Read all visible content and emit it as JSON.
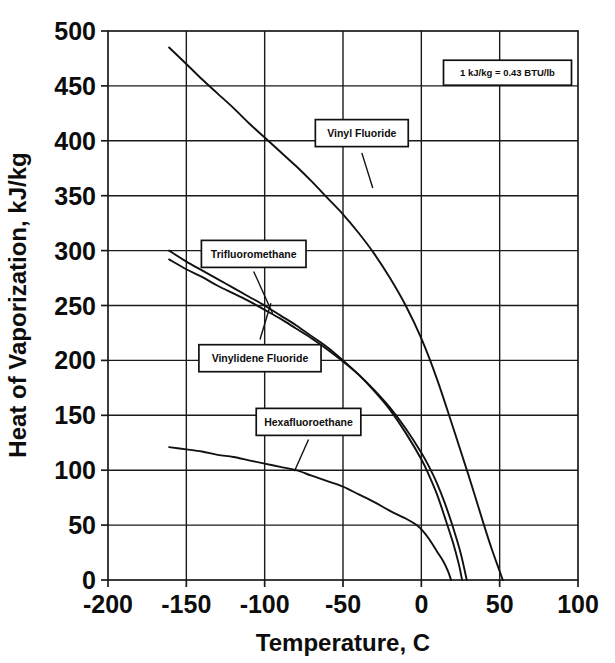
{
  "chart_data": {
    "type": "line",
    "title": "",
    "xlabel": "Temperature, C",
    "ylabel": "Heat of Vaporization, kJ/kg",
    "xlim": [
      -200,
      100
    ],
    "ylim": [
      0,
      500
    ],
    "xticks": [
      -200,
      -150,
      -100,
      -50,
      0,
      50,
      100
    ],
    "xtick_labels": [
      "-200",
      "-150",
      "-100",
      "-50",
      "0",
      "50",
      "100"
    ],
    "yticks": [
      0,
      50,
      100,
      150,
      200,
      250,
      300,
      350,
      400,
      450,
      500
    ],
    "ytick_labels": [
      "0",
      "50",
      "100",
      "150",
      "200",
      "250",
      "300",
      "350",
      "400",
      "450",
      "500"
    ],
    "grid": true,
    "legend_position": "inline-callouts",
    "annotations": [
      {
        "name": "unit-note",
        "text": "1 kJ/kg = 0.43 BTU/lb",
        "x": 55,
        "y": 462
      }
    ],
    "series": [
      {
        "name": "Vinyl Fluoride",
        "label_x": -38,
        "label_y": 407,
        "leader_from": [
          -38,
          389
        ],
        "leader_to": [
          -31,
          357
        ],
        "points": [
          [
            -161,
            485
          ],
          [
            -150,
            470
          ],
          [
            -140,
            456
          ],
          [
            -130,
            443
          ],
          [
            -120,
            430
          ],
          [
            -110,
            416
          ],
          [
            -100,
            403
          ],
          [
            -90,
            390
          ],
          [
            -80,
            377
          ],
          [
            -70,
            363
          ],
          [
            -60,
            348
          ],
          [
            -50,
            333
          ],
          [
            -40,
            316
          ],
          [
            -30,
            297
          ],
          [
            -20,
            275
          ],
          [
            -10,
            250
          ],
          [
            0,
            220
          ],
          [
            10,
            183
          ],
          [
            20,
            140
          ],
          [
            30,
            96
          ],
          [
            40,
            50
          ],
          [
            45,
            28
          ],
          [
            50,
            8
          ],
          [
            52,
            0
          ]
        ]
      },
      {
        "name": "Trifluoromethane",
        "label_x": -107,
        "label_y": 297,
        "leader_from": [
          -107,
          281
        ],
        "leader_to": [
          -95,
          243
        ],
        "points": [
          [
            -161,
            300
          ],
          [
            -150,
            290
          ],
          [
            -140,
            282
          ],
          [
            -130,
            274
          ],
          [
            -120,
            266
          ],
          [
            -110,
            258
          ],
          [
            -100,
            250
          ],
          [
            -90,
            241
          ],
          [
            -80,
            232
          ],
          [
            -70,
            222
          ],
          [
            -60,
            212
          ],
          [
            -50,
            200
          ],
          [
            -40,
            187
          ],
          [
            -30,
            172
          ],
          [
            -20,
            155
          ],
          [
            -10,
            134
          ],
          [
            0,
            110
          ],
          [
            5,
            95
          ],
          [
            10,
            78
          ],
          [
            15,
            57
          ],
          [
            20,
            35
          ],
          [
            24,
            14
          ],
          [
            26,
            0
          ]
        ]
      },
      {
        "name": "Vinylidene Fluoride",
        "label_x": -103,
        "label_y": 202,
        "leader_from": [
          -103,
          219
        ],
        "leader_to": [
          -96,
          252
        ],
        "points": [
          [
            -161,
            292
          ],
          [
            -150,
            283
          ],
          [
            -140,
            276
          ],
          [
            -130,
            268
          ],
          [
            -120,
            261
          ],
          [
            -110,
            254
          ],
          [
            -100,
            246
          ],
          [
            -90,
            238
          ],
          [
            -80,
            229
          ],
          [
            -70,
            220
          ],
          [
            -60,
            210
          ],
          [
            -50,
            199
          ],
          [
            -40,
            187
          ],
          [
            -30,
            173
          ],
          [
            -20,
            157
          ],
          [
            -10,
            138
          ],
          [
            0,
            116
          ],
          [
            5,
            103
          ],
          [
            10,
            88
          ],
          [
            15,
            70
          ],
          [
            20,
            49
          ],
          [
            25,
            25
          ],
          [
            29,
            0
          ]
        ]
      },
      {
        "name": "Hexafluoroethane",
        "label_x": -72,
        "label_y": 144,
        "leader_from": [
          -72,
          128
        ],
        "leader_to": [
          -81,
          99
        ],
        "points": [
          [
            -161,
            121
          ],
          [
            -150,
            119
          ],
          [
            -140,
            117
          ],
          [
            -130,
            114
          ],
          [
            -120,
            112
          ],
          [
            -110,
            109
          ],
          [
            -100,
            106
          ],
          [
            -90,
            103
          ],
          [
            -80,
            100
          ],
          [
            -70,
            95
          ],
          [
            -60,
            90
          ],
          [
            -50,
            85
          ],
          [
            -40,
            78
          ],
          [
            -30,
            71
          ],
          [
            -20,
            63
          ],
          [
            -10,
            56
          ],
          [
            -3,
            50
          ],
          [
            2,
            43
          ],
          [
            6,
            35
          ],
          [
            10,
            26
          ],
          [
            14,
            17
          ],
          [
            17,
            8
          ],
          [
            19,
            0
          ]
        ]
      }
    ]
  }
}
